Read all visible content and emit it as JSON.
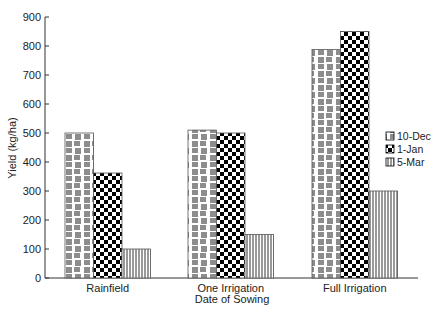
{
  "chart_data": {
    "type": "bar",
    "title": "",
    "xlabel": "Date of Sowing",
    "ylabel": "Yield (kg/ha)",
    "ylim": [
      0,
      900
    ],
    "yticks": [
      0,
      100,
      200,
      300,
      400,
      500,
      600,
      700,
      800,
      900
    ],
    "grid": false,
    "legend_position": "right-inside",
    "categories": [
      "Rainfield",
      "One Irrigation",
      "Full Irrigation"
    ],
    "series": [
      {
        "name": "10-Dec",
        "pattern": "mixed-lines",
        "values": [
          500,
          510,
          788
        ]
      },
      {
        "name": "1-Jan",
        "pattern": "checkerboard",
        "values": [
          362,
          500,
          850
        ]
      },
      {
        "name": "5-Mar",
        "pattern": "vertical-lines",
        "values": [
          100,
          150,
          300
        ]
      }
    ]
  },
  "colors": {
    "axis": "#333333",
    "bar_fill": "#ffffff",
    "pattern": "#000000",
    "text": "#222222"
  }
}
